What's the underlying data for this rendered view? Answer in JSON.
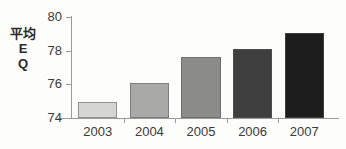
{
  "chart_data": {
    "type": "bar",
    "title": "",
    "subtitle": "",
    "xlabel": "",
    "ylabel": "平均EQ",
    "ylabel_lines": [
      "平均",
      "E",
      "Q"
    ],
    "categories": [
      "2003",
      "2004",
      "2005",
      "2006",
      "2007"
    ],
    "values": [
      74.95,
      76.1,
      77.65,
      78.1,
      79.05
    ],
    "ylim": [
      74,
      80
    ],
    "yticks": [
      74,
      76,
      78,
      80
    ],
    "ytick_labels": [
      "74",
      "76",
      "78",
      "80"
    ],
    "grid": false,
    "legend": "none",
    "bar_colors": [
      "#d5d5d2",
      "#a9a9a6",
      "#8b8b89",
      "#3f3f3f",
      "#1d1d1d"
    ],
    "series": [
      {
        "name": "平均EQ",
        "values": [
          74.95,
          76.1,
          77.65,
          78.1,
          79.05
        ]
      }
    ]
  }
}
